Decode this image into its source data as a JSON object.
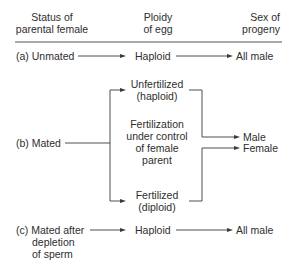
{
  "header": {
    "col1": [
      "Status of",
      "parental female"
    ],
    "col2": [
      "Ploidy",
      "of egg"
    ],
    "col3": [
      "Sex of",
      "progeny"
    ]
  },
  "rows": {
    "a": {
      "status": "(a) Unmated",
      "ploidy": "Haploid",
      "progeny": "All male"
    },
    "b": {
      "status": "(b) Mated",
      "unfertilized": [
        "Unfertilized",
        "(haploid)"
      ],
      "control": [
        "Fertilization",
        "under control",
        "of female",
        "parent"
      ],
      "fertilized": [
        "Fertilized",
        "(diploid)"
      ],
      "progeny_male": "Male",
      "progeny_female": "Female"
    },
    "c": {
      "status": [
        "(c) Mated after",
        "depletion",
        "of sperm"
      ],
      "ploidy": "Haploid",
      "progeny": "All male"
    }
  },
  "style": {
    "line_color": "#3a3a3a",
    "text_color": "#2e2e2e",
    "background": "#ffffff"
  }
}
